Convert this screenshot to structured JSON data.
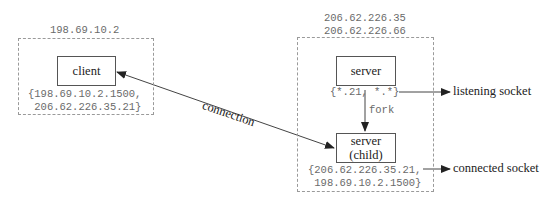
{
  "client_host": {
    "ip": "198.69.10.2",
    "box_label": "client",
    "socket_pair_line1": "{198.69.10.2.1500,",
    "socket_pair_line2": " 206.62.226.35.21}"
  },
  "server_host": {
    "ip_line1": "206.62.226.35",
    "ip_line2": "206.62.226.66",
    "server_label": "server",
    "listening_pair": "{*.21, *.*}",
    "fork_label": "fork",
    "child_label_line1": "server",
    "child_label_line2": "(child)",
    "connected_pair_line1": "{206.62.226.35.21,",
    "connected_pair_line2": " 198.69.10.2.1500}"
  },
  "arrows": {
    "connection_label": "connection",
    "listening_socket_label": "listening socket",
    "connected_socket_label": "connected socket"
  }
}
